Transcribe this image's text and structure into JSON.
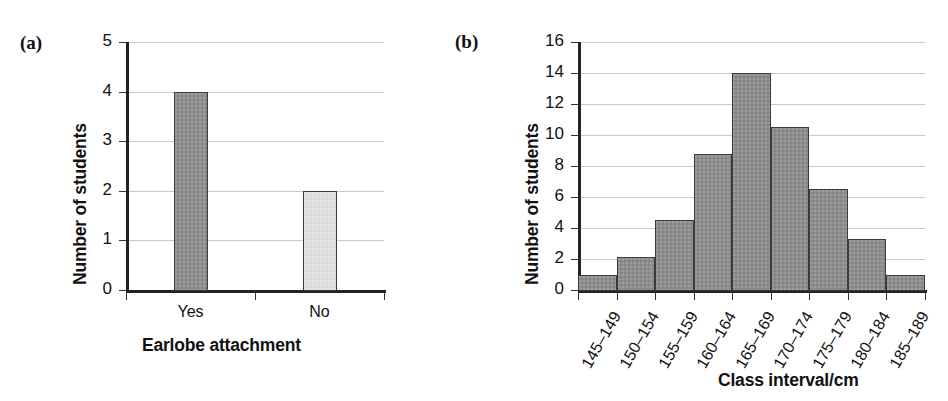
{
  "figure": {
    "panels": [
      {
        "tag": "(a)"
      },
      {
        "tag": "(b)"
      }
    ]
  },
  "chart_data": [
    {
      "type": "bar",
      "panel": "(a)",
      "title": "",
      "xlabel": "Earlobe attachment",
      "ylabel": "Number of students",
      "categories": [
        "Yes",
        "No"
      ],
      "values": [
        4,
        2
      ],
      "colors": [
        "#8d8d8d",
        "#dedede"
      ],
      "ylim": [
        0,
        5
      ],
      "ytick_labels": [
        "0",
        "1",
        "2",
        "3",
        "4",
        "5"
      ],
      "ytick_values": [
        0,
        1,
        2,
        3,
        4,
        5
      ],
      "grid": "horizontal",
      "legend": "none"
    },
    {
      "type": "bar",
      "panel": "(b)",
      "title": "",
      "xlabel": "Class interval/cm",
      "ylabel": "Number of students",
      "categories": [
        "145–149",
        "150–154",
        "155–159",
        "160–164",
        "165–169",
        "170–174",
        "175–179",
        "180–184",
        "185–189"
      ],
      "values": [
        1,
        2.1,
        4.5,
        8.8,
        14,
        10.5,
        6.5,
        3.3,
        1
      ],
      "bar_color": "#8d8d8d",
      "ylim": [
        0,
        16
      ],
      "ytick_labels": [
        "0",
        "2",
        "4",
        "6",
        "8",
        "10",
        "12",
        "14",
        "16"
      ],
      "ytick_values": [
        0,
        2,
        4,
        6,
        8,
        10,
        12,
        14,
        16
      ],
      "grid": "horizontal",
      "legend": "none",
      "histogram": true
    }
  ]
}
